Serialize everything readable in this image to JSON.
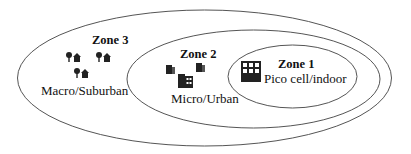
{
  "zones": [
    {
      "id": 3,
      "title": "Zone 3",
      "label": "Macro/Suburban",
      "icon": "house-tree-icon"
    },
    {
      "id": 2,
      "title": "Zone 2",
      "label": "Micro/Urban",
      "icon": "office-buildings-icon"
    },
    {
      "id": 1,
      "title": "Zone 1",
      "label": "Pico cell/indoor",
      "icon": "building-icon"
    }
  ],
  "colors": {
    "stroke": "#555555",
    "icon": "#222222",
    "background": "#ffffff"
  }
}
